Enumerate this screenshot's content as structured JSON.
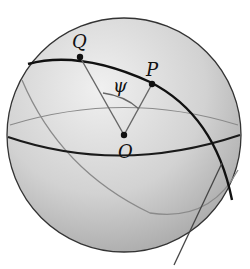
{
  "diagram": {
    "type": "sphere-great-circle",
    "labels": {
      "Q": "Q",
      "P": "P",
      "O": "O",
      "angle": "ψ"
    },
    "points": {
      "Q": {
        "x": 80,
        "y": 57
      },
      "P": {
        "x": 152,
        "y": 84
      },
      "O": {
        "x": 124,
        "y": 135
      }
    },
    "sphere": {
      "cx": 124,
      "cy": 135,
      "r": 117
    },
    "colors": {
      "sphere_fill_light": "#e6e6e6",
      "sphere_fill_dark": "#b8b8b8",
      "outline": "#333333",
      "great_circle": "#111111",
      "faint_lines": "#8a8a8a"
    }
  }
}
